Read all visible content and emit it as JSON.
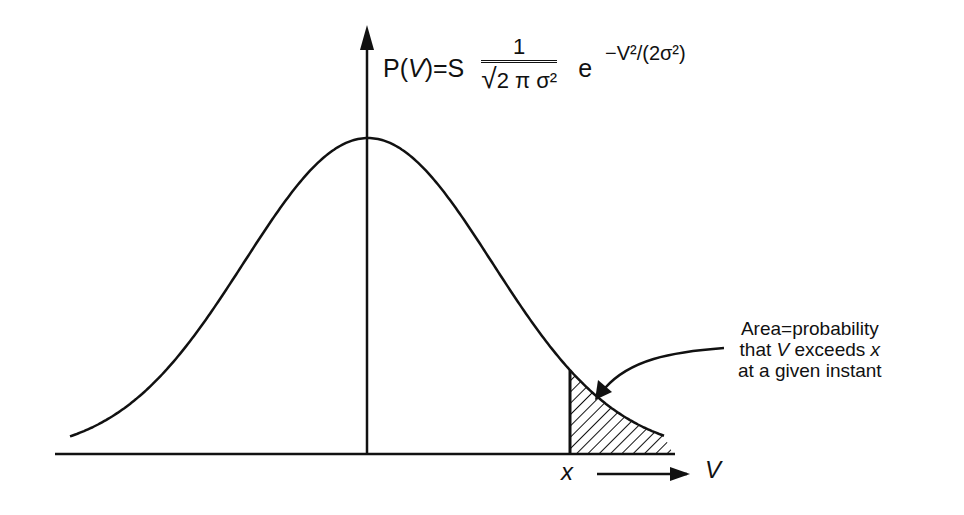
{
  "formula": {
    "lhs": "P(V)=S",
    "numerator": "1",
    "denominator": "2 π σ²",
    "base": "e",
    "exponent": "−V²/(2σ²)"
  },
  "axis_labels": {
    "threshold": "x",
    "variable": "V"
  },
  "annotation": {
    "line1": "Area=probability",
    "line2_pre": "that ",
    "line2_var": "V",
    "line2_mid": " exceeds ",
    "line2_x": "x",
    "line3": "at a given instant"
  },
  "curve": {
    "type": "gaussian",
    "center_px": 368,
    "peak_y_px": 138,
    "baseline_y_px": 454,
    "sigma_px": 124,
    "x_start_px": 70,
    "x_end_px": 665,
    "shade_from_px": 570,
    "stroke_color": "#111111"
  }
}
